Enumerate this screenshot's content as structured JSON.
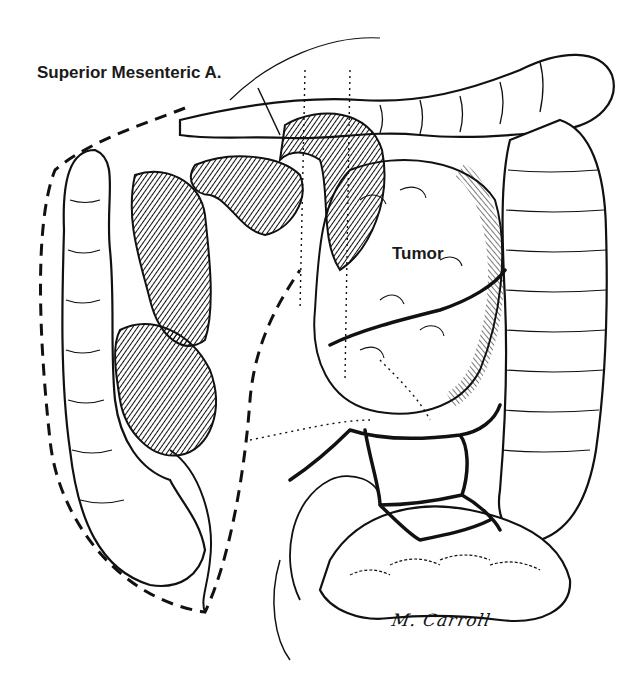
{
  "figure": {
    "type": "anatomical-illustration"
  },
  "labels": {
    "superior_mesenteric": "Superior Mesenteric A.",
    "tumor": "Tumor"
  },
  "signature": "M. Carroll",
  "colors": {
    "ink": "#111111",
    "background": "#ffffff"
  }
}
